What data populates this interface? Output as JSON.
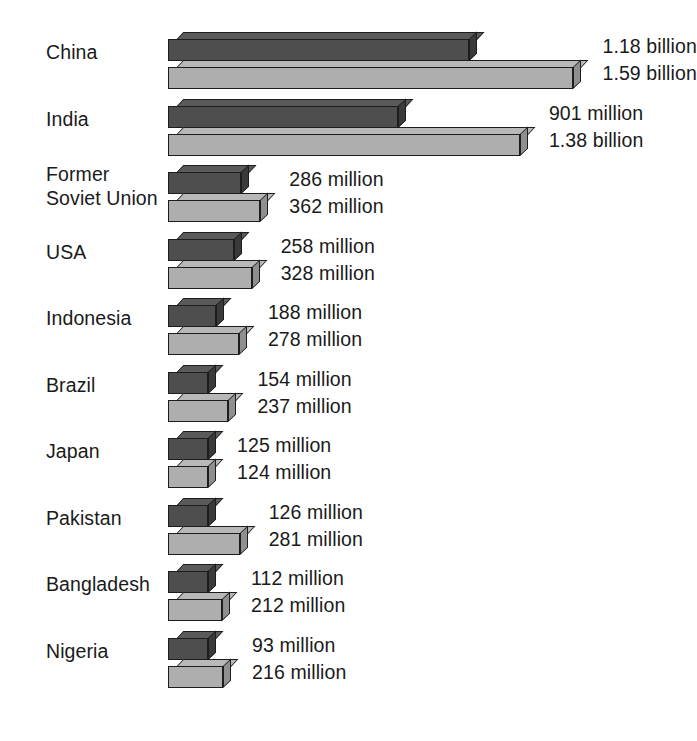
{
  "chart_data": {
    "type": "bar",
    "title": "",
    "subtitle": "",
    "xlabel": "",
    "ylabel": "",
    "orientation": "horizontal",
    "grid": false,
    "legend_position": "none",
    "units": "people",
    "xlim": [
      0,
      1590000000
    ],
    "categories": [
      "China",
      "India",
      "Former\nSoviet Union",
      "USA",
      "Indonesia",
      "Brazil",
      "Japan",
      "Pakistan",
      "Bangladesh",
      "Nigeria"
    ],
    "series": [
      {
        "name": "current",
        "color": "#4e4e4e",
        "values": [
          1180000000,
          901000000,
          286000000,
          258000000,
          188000000,
          154000000,
          125000000,
          126000000,
          112000000,
          93000000
        ],
        "labels": [
          "1.18 billion",
          "901 million",
          "286 million",
          "258 million",
          "188 million",
          "154 million",
          "125 million",
          "126 million",
          "112 million",
          "93 million"
        ]
      },
      {
        "name": "projected",
        "color": "#aeaeae",
        "values": [
          1590000000,
          1380000000,
          362000000,
          328000000,
          278000000,
          237000000,
          124000000,
          281000000,
          212000000,
          216000000
        ],
        "labels": [
          "1.59 billion",
          "1.38 billion",
          "362 million",
          "328 million",
          "278 million",
          "237 million",
          "124 million",
          "281 million",
          "212 million",
          "216 million"
        ]
      }
    ]
  },
  "rows": [
    {
      "category": "China",
      "lines": 1,
      "dark_label": "1.18 billion",
      "light_label": "1.59 billion",
      "dark_value": 1180000000,
      "light_value": 1590000000
    },
    {
      "category": "India",
      "lines": 1,
      "dark_label": "901 million",
      "light_label": "1.38 billion",
      "dark_value": 901000000,
      "light_value": 1380000000
    },
    {
      "category": "Former\nSoviet Union",
      "lines": 2,
      "dark_label": "286 million",
      "light_label": "362 million",
      "dark_value": 286000000,
      "light_value": 362000000
    },
    {
      "category": "USA",
      "lines": 1,
      "dark_label": "258 million",
      "light_label": "328 million",
      "dark_value": 258000000,
      "light_value": 328000000
    },
    {
      "category": "Indonesia",
      "lines": 1,
      "dark_label": "188 million",
      "light_label": "278 million",
      "dark_value": 188000000,
      "light_value": 278000000
    },
    {
      "category": "Brazil",
      "lines": 1,
      "dark_label": "154 million",
      "light_label": "237 million",
      "dark_value": 154000000,
      "light_value": 237000000
    },
    {
      "category": "Japan",
      "lines": 1,
      "dark_label": "125 million",
      "light_label": "124 million",
      "dark_value": 125000000,
      "light_value": 124000000
    },
    {
      "category": "Pakistan",
      "lines": 1,
      "dark_label": "126 million",
      "light_label": "281 million",
      "dark_value": 126000000,
      "light_value": 281000000
    },
    {
      "category": "Bangladesh",
      "lines": 1,
      "dark_label": "112 million",
      "light_label": "212 million",
      "dark_value": 112000000,
      "light_value": 212000000
    },
    {
      "category": "Nigeria",
      "lines": 1,
      "dark_label": "93 million",
      "light_label": "216 million",
      "dark_value": 93000000,
      "light_value": 216000000
    }
  ],
  "geometry": {
    "bar_origin_x": 168,
    "px_per_billion": 255,
    "row_pitch": 66.5,
    "first_row_top": 28,
    "label_gap": 20,
    "min_bar_px": 40
  },
  "colors": {
    "dark_front": "#4e4e4e",
    "dark_top": "#5a5a5a",
    "dark_side": "#3a3a3a",
    "light_front": "#aeaeae",
    "light_top": "#b8b8b8",
    "light_side": "#8f8f8f",
    "outline": "#1d1d1d",
    "text": "#1a1a1a",
    "background": "#ffffff"
  }
}
